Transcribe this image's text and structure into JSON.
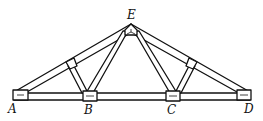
{
  "diagram": {
    "type": "roof-truss",
    "labels": {
      "A": "A",
      "B": "B",
      "C": "C",
      "D": "D",
      "E": "E"
    },
    "colors": {
      "stroke": "#111111",
      "fill": "#ffffff"
    }
  }
}
